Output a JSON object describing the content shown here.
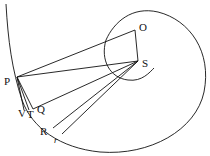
{
  "diagram": {
    "title": "",
    "stroke_color": "#111111",
    "background": "#ffffff",
    "points": {
      "P": {
        "label": "P",
        "x": 17,
        "y": 77
      },
      "O": {
        "label": "O",
        "x": 135,
        "y": 30
      },
      "S": {
        "label": "S",
        "x": 138,
        "y": 61
      },
      "V": {
        "label": "V",
        "x": 24,
        "y": 110
      },
      "T": {
        "label": "T",
        "x": 29,
        "y": 110
      },
      "Q": {
        "label": "Q",
        "x": 33,
        "y": 109
      },
      "R": {
        "label": "R",
        "x": 53,
        "y": 128
      },
      "r": {
        "label": "r",
        "x": 62,
        "y": 134
      }
    },
    "segments": [
      [
        "P",
        "O"
      ],
      [
        "O",
        "S"
      ],
      [
        "P",
        "S"
      ],
      [
        "Q",
        "S"
      ],
      [
        "R",
        "S"
      ],
      [
        "r",
        "S"
      ],
      [
        "P",
        "V"
      ],
      [
        "P",
        "T"
      ],
      [
        "P",
        "Q"
      ]
    ]
  }
}
